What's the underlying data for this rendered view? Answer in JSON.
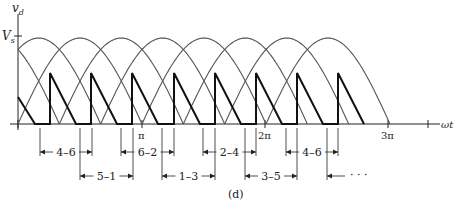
{
  "figure": {
    "caption": "(d)",
    "y_axis_label": "v",
    "y_axis_label_sub": "d",
    "y_tick_label": "V",
    "y_tick_label_sub": "s",
    "x_axis_label": "ωt",
    "x_ticks": [
      {
        "label": "π",
        "x": 142
      },
      {
        "label": "2π",
        "x": 265
      },
      {
        "label": "3π",
        "x": 388
      }
    ],
    "intervals_row1": [
      {
        "label": "4–6",
        "x1": 40,
        "x2": 92
      },
      {
        "label": "6–2",
        "x1": 121,
        "x2": 174
      },
      {
        "label": "2–4",
        "x1": 203,
        "x2": 256
      },
      {
        "label": "4–6",
        "x1": 286,
        "x2": 338
      }
    ],
    "intervals_row2": [
      {
        "label": "5–1",
        "x1": 80,
        "x2": 133
      },
      {
        "label": "1–3",
        "x1": 162,
        "x2": 215
      },
      {
        "label": "3–5",
        "x1": 245,
        "x2": 297
      }
    ],
    "continuation": "· · ·",
    "colors": {
      "curve": "#555555",
      "output": "#111111",
      "axis": "#222222"
    }
  },
  "chart_data": {
    "type": "line",
    "title": "",
    "xlabel": "ωt",
    "ylabel": "v_d",
    "y_reference": "V_s",
    "x_ticks": [
      "π",
      "2π",
      "3π"
    ],
    "series": [
      {
        "name": "line-to-line sine arcs",
        "description": "half-sine arcs of amplitude V_s, each spanning π, offset by π/3"
      },
      {
        "name": "output (thick)",
        "description": "sawtooth segments: jump at each commutation then decay to zero, period π/3"
      }
    ],
    "conduction_sequence": [
      "4–6",
      "5–1",
      "6–2",
      "1–3",
      "2–4",
      "3–5",
      "4–6",
      "..."
    ]
  }
}
